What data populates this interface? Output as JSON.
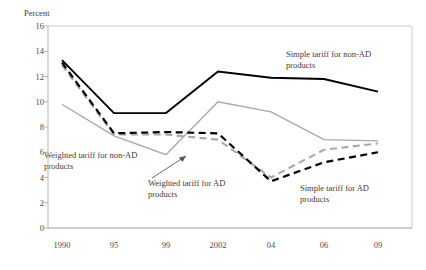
{
  "chart_data": {
    "type": "line",
    "title": "",
    "xlabel": "",
    "ylabel": "Percent",
    "categories": [
      "1990",
      "95",
      "99",
      "2002",
      "04",
      "06",
      "09"
    ],
    "x": [
      1990,
      1995,
      1999,
      2002,
      2004,
      2006,
      2009
    ],
    "ylim": [
      0,
      16
    ],
    "ytick_step": 2,
    "yticks": [
      "16",
      "14",
      "12",
      "10",
      "8",
      "6",
      "4",
      "2",
      "0"
    ],
    "grid": false,
    "legend": "annotations-inline",
    "series": [
      {
        "name": "Simple tariff for non-AD products",
        "style": "solid",
        "color": "#000000",
        "values": [
          13.3,
          9.1,
          9.1,
          12.4,
          11.9,
          11.8,
          10.8
        ]
      },
      {
        "name": "Weighted tariff for non-AD products",
        "style": "solid",
        "color": "#a8a8a8",
        "values": [
          9.8,
          7.3,
          5.8,
          10.0,
          9.2,
          7.0,
          6.9
        ]
      },
      {
        "name": "Simple tariff for AD products",
        "style": "dashed",
        "color": "#000000",
        "values": [
          13.1,
          7.5,
          7.6,
          7.5,
          3.7,
          5.2,
          6.0
        ]
      },
      {
        "name": "Weighted tariff for AD products",
        "style": "dashed",
        "color": "#a8a8a8",
        "values": [
          12.9,
          7.4,
          7.4,
          7.0,
          4.0,
          6.2,
          6.7
        ]
      }
    ],
    "annotations": [
      {
        "id": "simple-non-ad",
        "text_line1": "Simple tariff for non-AD",
        "text_line2": "products"
      },
      {
        "id": "weighted-non-ad",
        "text_line1": "Weighted tariff for non-AD",
        "text_line2": "products"
      },
      {
        "id": "weighted-ad",
        "text_line1": "Weighted tariff for AD",
        "text_line2": "products"
      },
      {
        "id": "simple-ad",
        "text_line1": "Simple tariff for AD",
        "text_line2": "products"
      }
    ]
  },
  "axis": {
    "y_title": "Percent"
  }
}
